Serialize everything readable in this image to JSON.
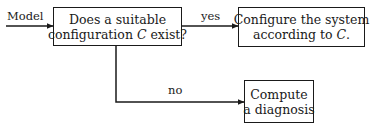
{
  "diagram": {
    "type": "flowchart",
    "input_label": "Model",
    "nodes": [
      {
        "id": "decision",
        "lines": [
          "Does a suitable",
          "configuration C exist?"
        ],
        "line1": "Does a suitable",
        "line2_pre": "configuration ",
        "line2_var": "C",
        "line2_post": " exist?"
      },
      {
        "id": "configure",
        "lines": [
          "Configure the system",
          "according to C."
        ],
        "line1": "Configure the system",
        "line2_pre": "according to ",
        "line2_var": "C",
        "line2_post": "."
      },
      {
        "id": "diagnose",
        "lines": [
          "Compute",
          "a diagnosis"
        ],
        "line1": "Compute",
        "line2": "a diagnosis"
      }
    ],
    "edges": [
      {
        "from": "input",
        "to": "decision",
        "label": "Model"
      },
      {
        "from": "decision",
        "to": "configure",
        "label": "yes"
      },
      {
        "from": "decision",
        "to": "diagnose",
        "label": "no"
      }
    ],
    "edge_labels": {
      "yes": "yes",
      "no": "no"
    },
    "colors": {
      "stroke": "#1a1a1a",
      "background": "#ffffff"
    }
  }
}
